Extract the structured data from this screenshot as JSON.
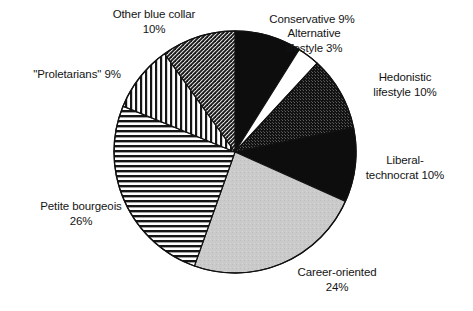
{
  "chart_data": {
    "type": "pie",
    "title": "",
    "subtitle": "",
    "xlabel": "",
    "ylabel": "",
    "legend_position": "none",
    "grid": false,
    "units": "percent",
    "start_angle_deg": 0,
    "direction": "clockwise",
    "categories": [
      "Conservative",
      "Alternative lifestyle",
      "Hedonistic lifestyle",
      "Liberal-technocrat",
      "Career-oriented",
      "Petite bourgeois",
      "\"Proletarians\"",
      "Other blue collar"
    ],
    "values": [
      9,
      3,
      10,
      10,
      24,
      26,
      9,
      10
    ],
    "slices": [
      {
        "name": "Conservative",
        "value": 9,
        "value_text": "9%",
        "label_text": "Conservative 9%",
        "fill": "solid-black",
        "color": "#0d0d0d"
      },
      {
        "name": "Alternative lifestyle",
        "value": 3,
        "value_text": "3%",
        "label_text": "Alternative\nlifestyle 3%",
        "fill": "solid-white",
        "color": "#ffffff"
      },
      {
        "name": "Hedonistic lifestyle",
        "value": 10,
        "value_text": "10%",
        "label_text": "Hedonistic\nlifestyle 10%",
        "fill": "dense-dot-dark",
        "color": "#1f1f1f"
      },
      {
        "name": "Liberal-technocrat",
        "value": 10,
        "value_text": "10%",
        "label_text": "Liberal-\ntechnocrat 10%",
        "fill": "solid-black",
        "color": "#080808"
      },
      {
        "name": "Career-oriented",
        "value": 24,
        "value_text": "24%",
        "label_text": "Career-oriented\n24%",
        "fill": "solid-light-gray",
        "color": "#c9c9c9"
      },
      {
        "name": "Petite bourgeois",
        "value": 26,
        "value_text": "26%",
        "label_text": "Petite bourgeois\n26%",
        "fill": "horizontal-lines",
        "color": "#3a3a3a"
      },
      {
        "name": "\"Proletarians\"",
        "value": 9,
        "value_text": "9%",
        "label_text": "\"Proletarians\" 9%",
        "fill": "vertical-lines",
        "color": "#3a3a3a"
      },
      {
        "name": "Other blue collar",
        "value": 10,
        "value_text": "10%",
        "label_text": "Other blue collar\n10%",
        "fill": "diagonal-crosshatch",
        "color": "#555555"
      }
    ]
  },
  "figure": {
    "background_color": "#ffffff",
    "outline_color": "#111111",
    "center_x": 235,
    "center_y": 152,
    "radius": 121
  }
}
